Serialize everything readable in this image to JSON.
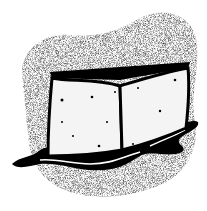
{
  "image": {
    "subject": "melting ice cube",
    "style": "black and white clipart",
    "colors": {
      "background": "#ffffff",
      "ink": "#000000",
      "stipple": "#555555",
      "cube_face": "#f4f4f4"
    }
  }
}
